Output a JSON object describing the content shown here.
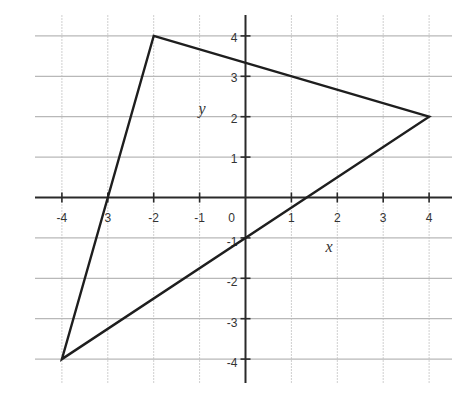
{
  "chart_data": {
    "type": "line",
    "title": "",
    "subtitle": "",
    "xlabel": "x",
    "ylabel": "y",
    "xlim": [
      -4.5,
      4.5
    ],
    "ylim": [
      -4.5,
      4.5
    ],
    "grid": true,
    "legend": null,
    "x_ticks": [
      -4,
      -3,
      -2,
      -1,
      0,
      1,
      2,
      3,
      4
    ],
    "x_tick_labels": [
      "-4",
      "3",
      "-2",
      "-1",
      "0",
      "1",
      "2",
      "3",
      "4"
    ],
    "y_ticks": [
      -4,
      -3,
      -2,
      -1,
      1,
      2,
      3,
      4
    ],
    "y_tick_labels": [
      "-4",
      "-3",
      "-2",
      "-1",
      "1",
      "2",
      "3",
      "4"
    ],
    "series": [
      {
        "name": "triangle",
        "closed": true,
        "points": [
          {
            "x": -2,
            "y": 4
          },
          {
            "x": 4,
            "y": 2
          },
          {
            "x": -4,
            "y": -4
          }
        ]
      }
    ],
    "annotations": []
  },
  "colors": {
    "line": "#1e1e1e",
    "axis": "#2a2a2a",
    "grid": "#c8c8c8",
    "background": "#ffffff"
  }
}
